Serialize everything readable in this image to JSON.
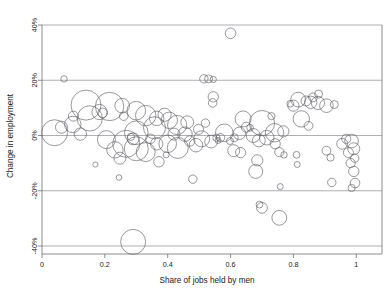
{
  "chart_data": {
    "type": "scatter",
    "title": "",
    "subtitle": "",
    "xlabel": "Share of jobs held by men",
    "ylabel": "Change in employment",
    "xlim": [
      0,
      1.05
    ],
    "ylim": [
      -0.4,
      0.4
    ],
    "grid": true,
    "legend": null,
    "x_ticks": [
      0,
      0.2,
      0.4,
      0.6,
      0.8,
      1
    ],
    "x_tick_labels": [
      "0",
      "0.2",
      "0.4",
      "0.6",
      "0.8",
      "1"
    ],
    "y_ticks": [
      0.4,
      0.2,
      0.0,
      -0.2,
      -0.4
    ],
    "y_tick_labels": [
      "40%",
      "20%",
      "0%",
      "-20%",
      "-40%"
    ],
    "marker_style": "open-circle",
    "marker_stroke": "#5a5a62",
    "gridline_color": "#8d8d93",
    "axis_color": "#6f6f75",
    "note": "Bubble chart: each circle is an occupation; radius encodes employment size.",
    "points": [
      {
        "x": 0.07,
        "y": 0.205,
        "r": 3.2
      },
      {
        "x": 0.6,
        "y": 0.37,
        "r": 5.3
      },
      {
        "x": 0.515,
        "y": 0.205,
        "r": 4.2
      },
      {
        "x": 0.53,
        "y": 0.205,
        "r": 4.0
      },
      {
        "x": 0.545,
        "y": 0.203,
        "r": 3.1
      },
      {
        "x": 0.545,
        "y": 0.14,
        "r": 5.2
      },
      {
        "x": 0.543,
        "y": 0.118,
        "r": 4.3
      },
      {
        "x": 0.14,
        "y": 0.11,
        "r": 15.0
      },
      {
        "x": 0.215,
        "y": 0.105,
        "r": 14.2
      },
      {
        "x": 0.183,
        "y": 0.085,
        "r": 7.6
      },
      {
        "x": 0.193,
        "y": 0.082,
        "r": 4.8
      },
      {
        "x": 0.152,
        "y": 0.062,
        "r": 12.6
      },
      {
        "x": 0.04,
        "y": 0.01,
        "r": 13.0
      },
      {
        "x": 0.098,
        "y": 0.04,
        "r": 8.2
      },
      {
        "x": 0.255,
        "y": 0.108,
        "r": 7.3
      },
      {
        "x": 0.26,
        "y": 0.07,
        "r": 4.3
      },
      {
        "x": 0.3,
        "y": 0.09,
        "r": 9.3
      },
      {
        "x": 0.33,
        "y": 0.072,
        "r": 10.2
      },
      {
        "x": 0.365,
        "y": 0.062,
        "r": 7.2
      },
      {
        "x": 0.39,
        "y": 0.075,
        "r": 6.6
      },
      {
        "x": 0.405,
        "y": 0.055,
        "r": 8.2
      },
      {
        "x": 0.358,
        "y": 0.028,
        "r": 11.0
      },
      {
        "x": 0.3,
        "y": 0.01,
        "r": 11.8
      },
      {
        "x": 0.268,
        "y": -0.03,
        "r": 13.5
      },
      {
        "x": 0.3,
        "y": -0.048,
        "r": 12.0
      },
      {
        "x": 0.33,
        "y": -0.06,
        "r": 9.5
      },
      {
        "x": 0.29,
        "y": -0.012,
        "r": 6.0
      },
      {
        "x": 0.283,
        "y": -0.005,
        "r": 3.6
      },
      {
        "x": 0.345,
        "y": -0.012,
        "r": 4.8
      },
      {
        "x": 0.365,
        "y": -0.03,
        "r": 6.2
      },
      {
        "x": 0.4,
        "y": -0.03,
        "r": 8.8
      },
      {
        "x": 0.432,
        "y": -0.045,
        "r": 10.5
      },
      {
        "x": 0.42,
        "y": 0.005,
        "r": 6.0
      },
      {
        "x": 0.455,
        "y": 0.005,
        "r": 7.2
      },
      {
        "x": 0.47,
        "y": -0.02,
        "r": 5.2
      },
      {
        "x": 0.49,
        "y": -0.035,
        "r": 6.8
      },
      {
        "x": 0.508,
        "y": -0.012,
        "r": 8.0
      },
      {
        "x": 0.538,
        "y": -0.022,
        "r": 6.4
      },
      {
        "x": 0.555,
        "y": -0.008,
        "r": 3.6
      },
      {
        "x": 0.56,
        "y": -0.018,
        "r": 3.0
      },
      {
        "x": 0.58,
        "y": 0.01,
        "r": 8.8
      },
      {
        "x": 0.568,
        "y": -0.008,
        "r": 4.2
      },
      {
        "x": 0.598,
        "y": -0.02,
        "r": 3.5
      },
      {
        "x": 0.61,
        "y": -0.055,
        "r": 6.0
      },
      {
        "x": 0.632,
        "y": -0.062,
        "r": 5.1
      },
      {
        "x": 0.64,
        "y": 0.06,
        "r": 8.0
      },
      {
        "x": 0.65,
        "y": 0.03,
        "r": 5.0
      },
      {
        "x": 0.662,
        "y": 0.028,
        "r": 3.4
      },
      {
        "x": 0.7,
        "y": 0.045,
        "r": 12.6
      },
      {
        "x": 0.672,
        "y": 0.0,
        "r": 7.0
      },
      {
        "x": 0.69,
        "y": -0.018,
        "r": 6.4
      },
      {
        "x": 0.715,
        "y": -0.008,
        "r": 7.3
      },
      {
        "x": 0.74,
        "y": 0.01,
        "r": 9.2
      },
      {
        "x": 0.742,
        "y": -0.03,
        "r": 5.1
      },
      {
        "x": 0.755,
        "y": -0.06,
        "r": 4.6
      },
      {
        "x": 0.77,
        "y": -0.07,
        "r": 3.2
      },
      {
        "x": 0.685,
        "y": -0.09,
        "r": 5.6
      },
      {
        "x": 0.68,
        "y": -0.13,
        "r": 7.0
      },
      {
        "x": 0.692,
        "y": -0.25,
        "r": 3.4
      },
      {
        "x": 0.7,
        "y": -0.262,
        "r": 5.4
      },
      {
        "x": 0.755,
        "y": -0.298,
        "r": 7.4
      },
      {
        "x": 0.758,
        "y": -0.185,
        "r": 3.0
      },
      {
        "x": 0.79,
        "y": 0.115,
        "r": 3.4
      },
      {
        "x": 0.8,
        "y": 0.108,
        "r": 5.6
      },
      {
        "x": 0.815,
        "y": 0.13,
        "r": 7.4
      },
      {
        "x": 0.84,
        "y": 0.125,
        "r": 5.0
      },
      {
        "x": 0.855,
        "y": 0.12,
        "r": 6.2
      },
      {
        "x": 0.862,
        "y": 0.138,
        "r": 4.4
      },
      {
        "x": 0.88,
        "y": 0.15,
        "r": 4.0
      },
      {
        "x": 0.878,
        "y": 0.118,
        "r": 6.6
      },
      {
        "x": 0.905,
        "y": 0.108,
        "r": 6.8
      },
      {
        "x": 0.93,
        "y": 0.112,
        "r": 4.0
      },
      {
        "x": 0.825,
        "y": 0.06,
        "r": 8.2
      },
      {
        "x": 0.848,
        "y": 0.035,
        "r": 4.4
      },
      {
        "x": 0.81,
        "y": -0.07,
        "r": 3.4
      },
      {
        "x": 0.812,
        "y": -0.105,
        "r": 3.0
      },
      {
        "x": 0.905,
        "y": -0.055,
        "r": 4.4
      },
      {
        "x": 0.918,
        "y": -0.08,
        "r": 3.6
      },
      {
        "x": 0.922,
        "y": -0.17,
        "r": 4.2
      },
      {
        "x": 0.955,
        "y": -0.03,
        "r": 5.4
      },
      {
        "x": 0.968,
        "y": -0.012,
        "r": 4.6
      },
      {
        "x": 0.985,
        "y": -0.02,
        "r": 6.8
      },
      {
        "x": 0.992,
        "y": -0.048,
        "r": 6.0
      },
      {
        "x": 0.975,
        "y": -0.062,
        "r": 5.0
      },
      {
        "x": 0.995,
        "y": -0.082,
        "r": 4.2
      },
      {
        "x": 0.982,
        "y": -0.1,
        "r": 4.6
      },
      {
        "x": 0.992,
        "y": -0.13,
        "r": 5.2
      },
      {
        "x": 0.996,
        "y": -0.172,
        "r": 4.8
      },
      {
        "x": 0.985,
        "y": -0.19,
        "r": 3.6
      },
      {
        "x": 0.17,
        "y": -0.105,
        "r": 2.6
      },
      {
        "x": 0.245,
        "y": -0.152,
        "r": 2.8
      },
      {
        "x": 0.48,
        "y": -0.158,
        "r": 4.2
      },
      {
        "x": 0.29,
        "y": -0.385,
        "r": 12.5
      },
      {
        "x": 0.1,
        "y": 0.07,
        "r": 5.0
      },
      {
        "x": 0.122,
        "y": 0.005,
        "r": 6.2
      },
      {
        "x": 0.205,
        "y": -0.015,
        "r": 9.0
      },
      {
        "x": 0.232,
        "y": -0.052,
        "r": 8.2
      },
      {
        "x": 0.248,
        "y": -0.082,
        "r": 6.0
      },
      {
        "x": 0.43,
        "y": 0.038,
        "r": 9.6
      },
      {
        "x": 0.462,
        "y": 0.048,
        "r": 6.4
      },
      {
        "x": 0.498,
        "y": 0.022,
        "r": 5.0
      },
      {
        "x": 0.52,
        "y": 0.045,
        "r": 4.2
      },
      {
        "x": 0.062,
        "y": 0.03,
        "r": 6.0
      },
      {
        "x": 0.372,
        "y": -0.095,
        "r": 5.2
      },
      {
        "x": 0.395,
        "y": -0.07,
        "r": 3.0
      },
      {
        "x": 0.612,
        "y": -0.008,
        "r": 4.0
      },
      {
        "x": 0.628,
        "y": 0.008,
        "r": 6.2
      },
      {
        "x": 0.73,
        "y": 0.07,
        "r": 3.6
      },
      {
        "x": 0.768,
        "y": 0.015,
        "r": 5.6
      }
    ]
  }
}
